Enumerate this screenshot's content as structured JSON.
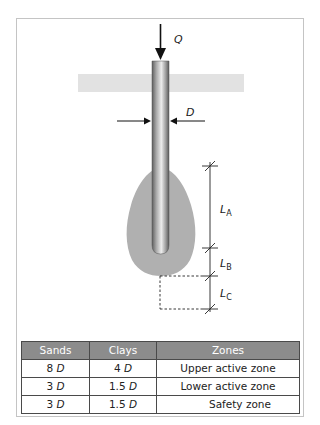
{
  "diagram": {
    "labels": {
      "load": "Q",
      "diameter": "D",
      "zone_a": {
        "main": "L",
        "sub": "A"
      },
      "zone_b": {
        "main": "L",
        "sub": "B"
      },
      "zone_c": {
        "main": "L",
        "sub": "C"
      }
    },
    "colors": {
      "ground": "#e2e2e2",
      "bulb": "#b0b0b0",
      "pile_dark": "#6e6e6e",
      "pile_light": "#e8e8e8",
      "line": "#222222",
      "table_header": "#8c8c8c",
      "table_border": "#4a4a4a"
    }
  },
  "table": {
    "headers": [
      "Sands",
      "Clays",
      "Zones"
    ],
    "rows": [
      {
        "sands_num": "8",
        "sands_unit": "D",
        "clays_num": "4",
        "clays_unit": "D",
        "zone": "Upper active zone"
      },
      {
        "sands_num": "3",
        "sands_unit": "D",
        "clays_num": "1.5",
        "clays_unit": "D",
        "zone": "Lower active zone"
      },
      {
        "sands_num": "3",
        "sands_unit": "D",
        "clays_num": "1.5",
        "clays_unit": "D",
        "zone": "Safety zone"
      }
    ]
  }
}
